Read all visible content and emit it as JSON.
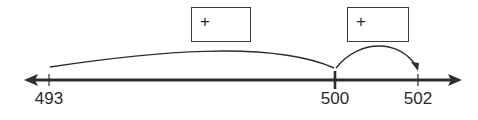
{
  "diagram": {
    "type": "open-number-line",
    "line": {
      "direction": "both-arrows"
    },
    "ticks": [
      {
        "value": "493",
        "x": 49
      },
      {
        "value": "500",
        "x": 335
      },
      {
        "value": "502",
        "x": 418
      }
    ],
    "jumps": [
      {
        "from": "493",
        "to": "500",
        "box_label": "+",
        "box_value": ""
      },
      {
        "from": "500",
        "to": "502",
        "box_label": "+",
        "box_value": ""
      }
    ]
  }
}
